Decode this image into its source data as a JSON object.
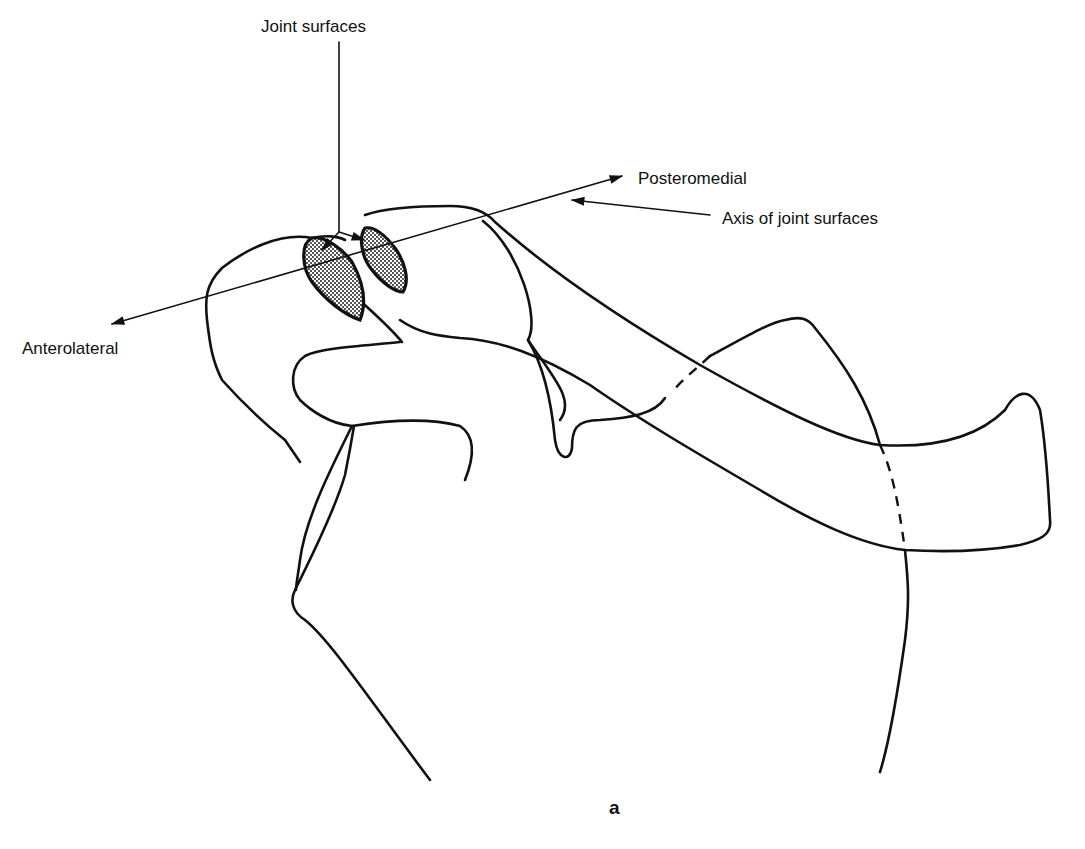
{
  "diagram": {
    "type": "anatomical-line-drawing",
    "figure_letter": "a",
    "labels": {
      "joint_surfaces": "Joint surfaces",
      "posteromedial": "Posteromedial",
      "axis": "Axis of joint surfaces",
      "anterolateral": "Anterolateral"
    },
    "colors": {
      "line": "#111111",
      "background": "#ffffff",
      "stipple": "#555555"
    }
  }
}
